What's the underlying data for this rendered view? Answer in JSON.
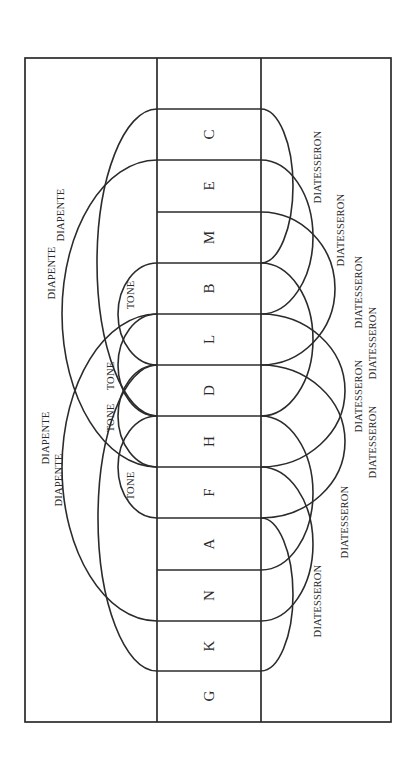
{
  "diagram": {
    "frame": {
      "x": 25,
      "y": 58,
      "w": 366,
      "h": 664
    },
    "column": {
      "x1": 157,
      "x2": 261
    },
    "rows_y": [
      58,
      109,
      160,
      212,
      263,
      314,
      365,
      416,
      467,
      518,
      570,
      621,
      671,
      721
    ],
    "notes": [
      "",
      "C",
      "E",
      "M",
      "B",
      "L",
      "D",
      "H",
      "F",
      "A",
      "N",
      "K",
      "G"
    ],
    "interval_names": {
      "fifth": "DIAPENTE",
      "fourth": "DIATESSERON",
      "tone": "TONE"
    },
    "left_arcs_diapente": [
      {
        "from": 109,
        "to": 416,
        "reach": 97
      },
      {
        "from": 160,
        "to": 467,
        "reach": 62
      },
      {
        "from": 314,
        "to": 621,
        "reach": 62
      },
      {
        "from": 365,
        "to": 671,
        "reach": 98
      }
    ],
    "left_arcs_tone": [
      {
        "from": 263,
        "to": 365,
        "reach": 118
      },
      {
        "from": 314,
        "to": 416,
        "reach": 118
      },
      {
        "from": 365,
        "to": 467,
        "reach": 118
      },
      {
        "from": 416,
        "to": 518,
        "reach": 118
      }
    ],
    "right_arcs_diatesseron": [
      {
        "from": 109,
        "to": 263,
        "reach": 293
      },
      {
        "from": 160,
        "to": 314,
        "reach": 313
      },
      {
        "from": 212,
        "to": 365,
        "reach": 335
      },
      {
        "from": 263,
        "to": 416,
        "reach": 313
      },
      {
        "from": 314,
        "to": 467,
        "reach": 345
      },
      {
        "from": 365,
        "to": 518,
        "reach": 345
      },
      {
        "from": 416,
        "to": 570,
        "reach": 313
      },
      {
        "from": 467,
        "to": 621,
        "reach": 313
      },
      {
        "from": 518,
        "to": 671,
        "reach": 293
      }
    ],
    "labels": [
      {
        "text": "DIAPENTE",
        "x": 51,
        "y": 273
      },
      {
        "text": "DIAPENTE",
        "x": 60,
        "y": 215
      },
      {
        "text": "DIAPENTE",
        "x": 45,
        "y": 438
      },
      {
        "text": "DIAPENTE",
        "x": 58,
        "y": 480
      },
      {
        "text": "TONE",
        "x": 130,
        "y": 295
      },
      {
        "text": "TONE",
        "x": 110,
        "y": 376
      },
      {
        "text": "TONE",
        "x": 110,
        "y": 418
      },
      {
        "text": "TONE",
        "x": 130,
        "y": 486
      },
      {
        "text": "DIATESSERON",
        "x": 317,
        "y": 167
      },
      {
        "text": "DIATESSERON",
        "x": 340,
        "y": 230
      },
      {
        "text": "DIATESSERON",
        "x": 358,
        "y": 292
      },
      {
        "text": "DIATESSERON",
        "x": 372,
        "y": 343
      },
      {
        "text": "DIATESSERON",
        "x": 358,
        "y": 396
      },
      {
        "text": "DIATESSERON",
        "x": 372,
        "y": 442
      },
      {
        "text": "DIATESSERON",
        "x": 344,
        "y": 522
      },
      {
        "text": "DIATESSERON",
        "x": 317,
        "y": 601
      }
    ]
  }
}
